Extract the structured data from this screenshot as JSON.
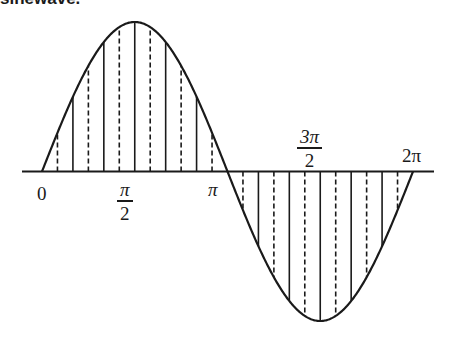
{
  "caption_partial": "sinewave.",
  "diagram": {
    "type": "sine-wave",
    "stroke_color": "#1a1a1a",
    "background": "#ffffff",
    "x_range_rad": [
      0,
      6.283185
    ],
    "strip_step": "pi/12",
    "line_styles": {
      "even_multiple": "solid",
      "odd_multiple": "dashed"
    }
  },
  "labels": {
    "zero": "0",
    "half_pi": {
      "num": "π",
      "den": "2"
    },
    "pi": "π",
    "three_half_pi": {
      "num": "3π",
      "den": "2"
    },
    "two_pi": "2π"
  }
}
